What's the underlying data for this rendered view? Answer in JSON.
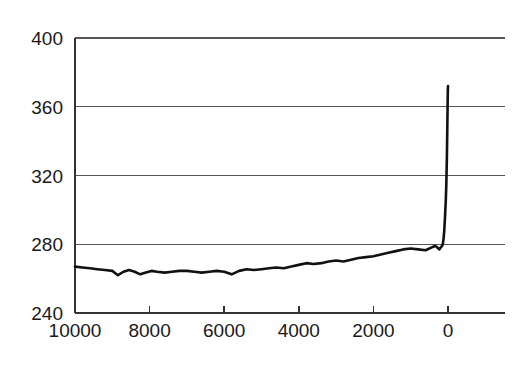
{
  "chart_data": {
    "type": "line",
    "title": "",
    "subtitle": "",
    "xlabel": "",
    "ylabel": "",
    "xlim": [
      10000,
      0
    ],
    "ylim": [
      240,
      400
    ],
    "x_reversed": true,
    "grid": true,
    "legend": null,
    "x_ticks": [
      10000,
      8000,
      6000,
      4000,
      2000,
      0
    ],
    "x_tick_labels": [
      "10000",
      "8000",
      "6000",
      "4000",
      "2000",
      "0"
    ],
    "x_minor_ticks": [
      9000,
      7000,
      5000,
      3000,
      1000
    ],
    "y_ticks": [
      240,
      280,
      320,
      360,
      400
    ],
    "y_tick_labels": [
      "240",
      "280",
      "320",
      "360",
      "400"
    ],
    "series": [
      {
        "name": "co2-concentration",
        "color": "#111111",
        "x": [
          10000,
          9800,
          9600,
          9400,
          9200,
          9000,
          8850,
          8700,
          8550,
          8400,
          8250,
          8100,
          7950,
          7800,
          7600,
          7400,
          7200,
          7000,
          6800,
          6600,
          6400,
          6200,
          6000,
          5800,
          5600,
          5400,
          5200,
          5000,
          4800,
          4600,
          4400,
          4200,
          4000,
          3800,
          3600,
          3400,
          3200,
          3000,
          2800,
          2600,
          2400,
          2200,
          2000,
          1800,
          1600,
          1400,
          1200,
          1000,
          800,
          600,
          450,
          350,
          300,
          260,
          230,
          200,
          180,
          160,
          140,
          120,
          100,
          80,
          60,
          45,
          30,
          20,
          12,
          6,
          0
        ],
        "values": [
          267,
          266.5,
          266,
          265.5,
          265,
          264.5,
          262,
          264,
          265,
          264,
          262.5,
          263.5,
          264.5,
          264,
          263.5,
          264,
          264.5,
          264.5,
          264,
          263.5,
          264,
          264.5,
          264,
          262.5,
          264.5,
          265.5,
          265,
          265.5,
          266,
          266.5,
          266,
          267,
          268,
          269,
          268.5,
          269,
          270,
          270.5,
          270,
          271,
          272,
          272.5,
          273,
          274,
          275,
          276,
          277,
          277.5,
          277,
          276.5,
          278,
          279,
          278.5,
          277.5,
          277,
          278,
          278.5,
          279,
          280,
          283,
          288,
          296,
          305,
          315,
          330,
          345,
          358,
          368,
          372
        ]
      }
    ]
  },
  "axes": {
    "y_axis_name": "ppm-axis",
    "x_axis_name": "years-before-present-axis"
  }
}
